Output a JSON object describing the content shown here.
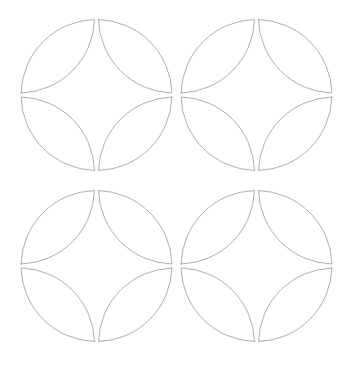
{
  "canvas": {
    "width": 363,
    "height": 366,
    "background_color": "#ffffff",
    "description": "Geometric line-art pattern: 2x2 grid of quatrefoil motifs"
  },
  "style": {
    "stroke_color": "#9a9a9a",
    "stroke_width": 0.8,
    "fill": "none"
  },
  "chart_data": {
    "type": "diagram",
    "title": "",
    "subtitle": "",
    "xlabel": "",
    "ylabel": "",
    "grid": false,
    "legend": null,
    "annotations": [],
    "geometry": {
      "shape_name": "quatrefoil-circle-motif",
      "petal_shape": "vesica-lens",
      "petals_per_motif": 4,
      "motif_radius": 75.5,
      "cusp_gap": 2.0,
      "grid_rows": 2,
      "grid_cols": 2,
      "motif_centers": [
        {
          "id": "motif-r1c1",
          "cx": 96.5,
          "cy": 95.0
        },
        {
          "id": "motif-r1c2",
          "cx": 256.5,
          "cy": 95.0
        },
        {
          "id": "motif-r2c1",
          "cx": 96.5,
          "cy": 266.0
        },
        {
          "id": "motif-r2c2",
          "cx": 256.5,
          "cy": 266.0
        }
      ],
      "petal_rotations_deg": [
        0,
        90,
        180,
        270
      ]
    },
    "x": [
      96.5,
      256.5
    ],
    "y": [
      95.0,
      266.0
    ],
    "xlim": [
      0,
      363
    ],
    "ylim": [
      0,
      366
    ]
  }
}
